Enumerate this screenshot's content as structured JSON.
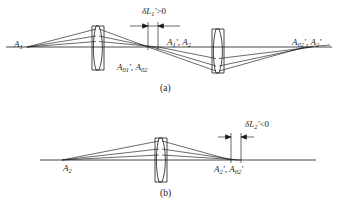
{
  "figure": {
    "background_color": "#ffffff",
    "ink_color": "#1a1a1a",
    "width": 338,
    "height": 208
  },
  "panel_a": {
    "caption": "(a)",
    "object_label": "A",
    "object_sub": "1",
    "paraxial_image_label": "A",
    "paraxial_image_sub": "01",
    "paraxial_image_prime": "′",
    "center_upper_label_1": "A",
    "center_upper_sub_1": "1",
    "center_upper_prime_1": "′",
    "center_upper_label_2": "A",
    "center_upper_sub_2": "2",
    "center_lower_label_1": "A",
    "center_lower_sub_1": "01",
    "center_lower_prime_1": "′",
    "center_lower_label_2": "A",
    "center_lower_sub_2": "02",
    "right_label_1": "A",
    "right_sub_1": "02",
    "right_prime_1": "′",
    "right_label_2": "A",
    "right_sub_2": "2",
    "right_prime_2": "′",
    "dimension_symbol": "δL",
    "dimension_sub": "1",
    "dimension_prime": "′",
    "dimension_relation": ">0",
    "dimension_text": "δL₁′>0",
    "lens_count": 2
  },
  "panel_b": {
    "caption": "(b)",
    "object_label": "A",
    "object_sub": "2",
    "right_label_1": "A",
    "right_sub_1": "2",
    "right_prime_1": "′",
    "right_label_2": "A",
    "right_sub_2": "02",
    "right_prime_2": "′",
    "dimension_symbol": "δL",
    "dimension_sub": "2",
    "dimension_prime": "′",
    "dimension_relation": "<0",
    "dimension_text": "δL₂′<0",
    "lens_count": 1
  }
}
